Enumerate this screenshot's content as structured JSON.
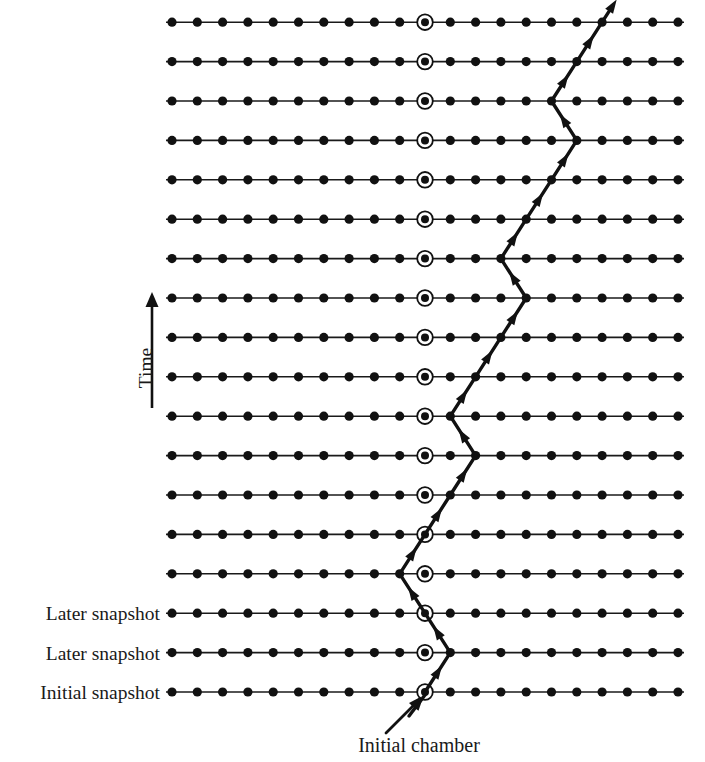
{
  "figure": {
    "title_visible": false,
    "background_color": "#ffffff",
    "ink_color": "#111111"
  },
  "axis": {
    "time_label": "Time",
    "time_arrow_direction": "up",
    "time_label_x": 152,
    "time_label_y": 368,
    "arrow_x": 152,
    "arrow_top_y": 292,
    "arrow_bottom_y": 408
  },
  "caption": {
    "initial_chamber_label": "Initial chamber",
    "initial_chamber_x": 419,
    "initial_chamber_y": 752,
    "pointer_from_x": 386,
    "pointer_from_y": 733,
    "pointer_to_x": 418,
    "pointer_to_y": 700
  },
  "lattice": {
    "columns": 21,
    "rows": 18,
    "x_start": 172,
    "x_spacing": 25.3,
    "y_bottom": 692,
    "y_spacing": 39.4,
    "dot_radius": 4.6,
    "chamber_column_index": 10,
    "chamber_ring_outer_radius": 7.8,
    "chamber_inner_radius": 4.0,
    "line_extend": 6
  },
  "row_labels": [
    {
      "row_index": 0,
      "text": "Initial snapshot"
    },
    {
      "row_index": 1,
      "text": "Later snapshot"
    },
    {
      "row_index": 2,
      "text": "Later snapshot"
    }
  ],
  "row_label_right_x": 160,
  "walk": {
    "description": "Random walk of a particle through chambers over time, starting at the initial chamber and moving one chamber left or right per time step.",
    "start_row": 0,
    "start_column": 10,
    "columns_by_row": [
      10,
      11,
      10,
      9,
      10,
      11,
      12,
      11,
      12,
      13,
      14,
      13,
      14,
      15,
      16,
      15,
      16,
      17
    ],
    "arrowhead_on_each_segment": true,
    "entry_stub": {
      "from_x": 409,
      "from_y": 716,
      "to_x": 425,
      "to_y": 695
    }
  },
  "chart_data": {
    "type": "line",
    "xlabel": "Chamber position",
    "ylabel": "Time",
    "x": [
      10,
      11,
      10,
      9,
      10,
      11,
      12,
      11,
      12,
      13,
      14,
      13,
      14,
      15,
      16,
      15,
      16,
      17
    ],
    "y": [
      0,
      1,
      2,
      3,
      4,
      5,
      6,
      7,
      8,
      9,
      10,
      11,
      12,
      13,
      14,
      15,
      16,
      17
    ],
    "xlim": [
      0,
      20
    ],
    "ylim": [
      0,
      17
    ],
    "grid": false,
    "legend": null,
    "annotations": [
      "Initial chamber",
      "Initial snapshot",
      "Later snapshot",
      "Later snapshot",
      "Time"
    ]
  }
}
